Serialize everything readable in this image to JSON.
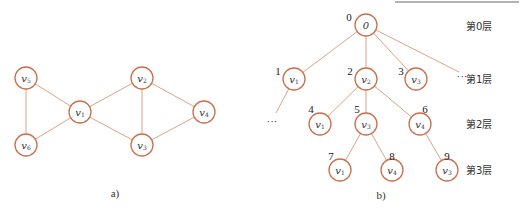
{
  "colors": {
    "node_stroke": "#c9714e",
    "edge": "#d9a487",
    "text": "#333333",
    "top_rule": "#9a9a9a"
  },
  "graph_a": {
    "caption": "a)",
    "nodes": [
      {
        "id": "v5",
        "base": "v",
        "sub": "5",
        "x": 26,
        "y": 78
      },
      {
        "id": "v6",
        "base": "v",
        "sub": "6",
        "x": 26,
        "y": 145
      },
      {
        "id": "v1",
        "base": "v",
        "sub": "1",
        "x": 80,
        "y": 112
      },
      {
        "id": "v2",
        "base": "v",
        "sub": "2",
        "x": 142,
        "y": 78
      },
      {
        "id": "v3",
        "base": "v",
        "sub": "3",
        "x": 142,
        "y": 145
      },
      {
        "id": "v4",
        "base": "v",
        "sub": "4",
        "x": 204,
        "y": 112
      }
    ],
    "edges": [
      [
        "v5",
        "v6"
      ],
      [
        "v5",
        "v1"
      ],
      [
        "v6",
        "v1"
      ],
      [
        "v1",
        "v2"
      ],
      [
        "v1",
        "v3"
      ],
      [
        "v2",
        "v3"
      ],
      [
        "v2",
        "v4"
      ],
      [
        "v3",
        "v4"
      ]
    ]
  },
  "graph_b": {
    "caption": "b)",
    "levels": [
      "第0层",
      "第1层",
      "第2层",
      "第3层"
    ],
    "nodes": [
      {
        "key": "n0",
        "order": "0",
        "base": "0",
        "sub": "",
        "x": 366,
        "y": 25,
        "ox": 349,
        "oy": 17
      },
      {
        "key": "n1",
        "order": "1",
        "base": "v",
        "sub": "1",
        "x": 294,
        "y": 79,
        "ox": 278,
        "oy": 71
      },
      {
        "key": "n2",
        "order": "2",
        "base": "v",
        "sub": "2",
        "x": 366,
        "y": 79,
        "ox": 350,
        "oy": 71
      },
      {
        "key": "n3",
        "order": "3",
        "base": "v",
        "sub": "3",
        "x": 416,
        "y": 79,
        "ox": 401,
        "oy": 71
      },
      {
        "key": "n4",
        "order": "4",
        "base": "v",
        "sub": "1",
        "x": 320,
        "y": 124,
        "ox": 311,
        "oy": 109
      },
      {
        "key": "n5",
        "order": "5",
        "base": "v",
        "sub": "3",
        "x": 366,
        "y": 124,
        "ox": 357,
        "oy": 109
      },
      {
        "key": "n6",
        "order": "6",
        "base": "v",
        "sub": "4",
        "x": 420,
        "y": 124,
        "ox": 425,
        "oy": 109
      },
      {
        "key": "n7",
        "order": "7",
        "base": "v",
        "sub": "1",
        "x": 340,
        "y": 170,
        "ox": 331,
        "oy": 156
      },
      {
        "key": "n8",
        "order": "8",
        "base": "v",
        "sub": "4",
        "x": 392,
        "y": 170,
        "ox": 392,
        "oy": 156
      },
      {
        "key": "n9",
        "order": "9",
        "base": "v",
        "sub": "3",
        "x": 447,
        "y": 170,
        "ox": 447,
        "oy": 156
      }
    ],
    "edges": [
      [
        "n0",
        "n1"
      ],
      [
        "n0",
        "n2"
      ],
      [
        "n0",
        "n3"
      ],
      [
        "n2",
        "n4"
      ],
      [
        "n2",
        "n5"
      ],
      [
        "n2",
        "n6"
      ],
      [
        "n5",
        "n7"
      ],
      [
        "n5",
        "n8"
      ],
      [
        "n6",
        "n9"
      ]
    ],
    "extra_edges": [
      {
        "x1": 366,
        "y1": 25,
        "x2": 459,
        "y2": 72
      },
      {
        "x1": 294,
        "y1": 79,
        "x2": 276,
        "y2": 113
      }
    ],
    "ellipses": [
      {
        "text": "···",
        "x": 462,
        "y": 76
      },
      {
        "text": "···",
        "x": 272,
        "y": 121
      }
    ]
  }
}
